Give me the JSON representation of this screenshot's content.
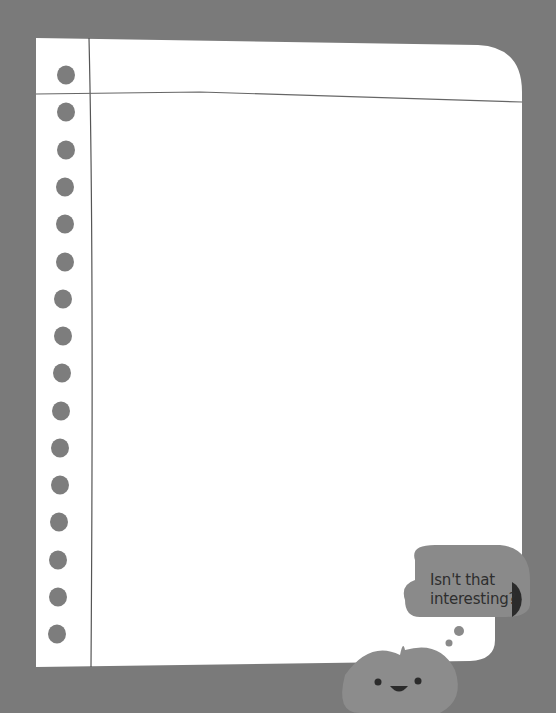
{
  "paper": {
    "holes_count": 16,
    "colors": {
      "background": "#7a7a7a",
      "paper": "#ffffff",
      "hole": "#7d7d7d",
      "line": "#555555"
    }
  },
  "mascot": {
    "speech": "Isn't that interesting?",
    "speech_line1": "Isn't that",
    "speech_line2": "interesting?",
    "colors": {
      "bubble": "#8a8a8a",
      "face": "#8c8c8c",
      "dark": "#2b2b2b"
    }
  }
}
